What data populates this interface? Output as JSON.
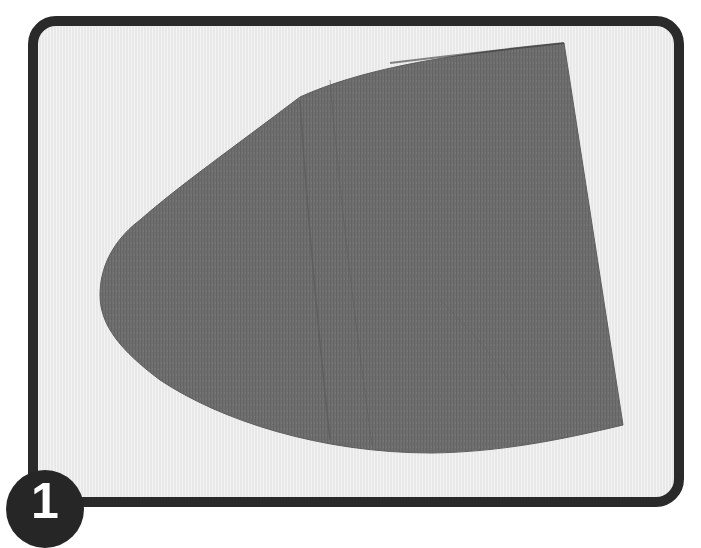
{
  "figure": {
    "step_number": "1",
    "frame": {
      "border_color": "#2a2a2a",
      "background_color": "#ededed"
    },
    "fabric_piece": {
      "description": "gray fabric pattern piece cut in a rounded half-oval shape",
      "fill_color": "#6e6e6e",
      "fold_line_color": "#5a5a5a"
    },
    "badge": {
      "background_color": "#262626",
      "text_color": "#ffffff"
    }
  }
}
